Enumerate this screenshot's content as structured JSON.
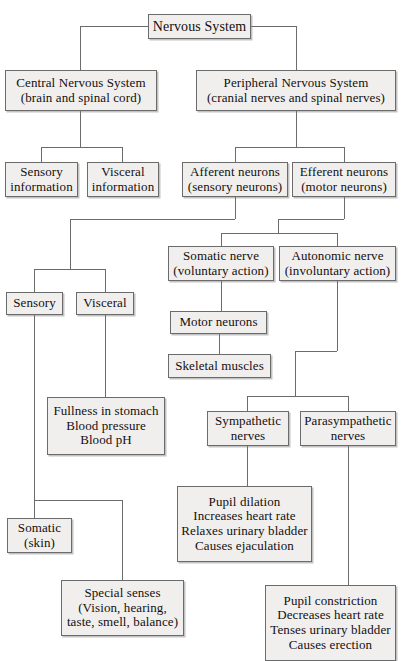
{
  "diagram": {
    "style": {
      "box_fill": "#f0efee",
      "box_border": "#6b6b6b",
      "text_color": "#14100e",
      "line_color": "#6b6b6b",
      "page_background": "#ffffff"
    },
    "nodes": [
      {
        "id": "nervous-system",
        "label": "Nervous System",
        "x": 148,
        "y": 14,
        "w": 103,
        "h": 25,
        "font": 14
      },
      {
        "id": "central-nervous-system",
        "label": "Central Nervous System\n(brain and spinal cord)",
        "x": 5,
        "y": 70,
        "w": 152,
        "h": 41,
        "font": 13
      },
      {
        "id": "peripheral-nervous-system",
        "label": "Peripheral Nervous System\n(cranial nerves and spinal nerves)",
        "x": 196,
        "y": 70,
        "w": 200,
        "h": 41,
        "font": 13
      },
      {
        "id": "sensory-information",
        "label": "Sensory\ninformation",
        "x": 5,
        "y": 162,
        "w": 73,
        "h": 35,
        "font": 13
      },
      {
        "id": "visceral-information",
        "label": "Visceral\ninformation",
        "x": 87,
        "y": 162,
        "w": 72,
        "h": 35,
        "font": 13
      },
      {
        "id": "afferent-neurons",
        "label": "Afferent neurons\n(sensory neurons)",
        "x": 182,
        "y": 162,
        "w": 106,
        "h": 35,
        "font": 13
      },
      {
        "id": "efferent-neurons",
        "label": "Efferent neurons\n(motor neurons)",
        "x": 292,
        "y": 162,
        "w": 104,
        "h": 35,
        "font": 13
      },
      {
        "id": "somatic-nerve",
        "label": "Somatic nerve\n(voluntary action)",
        "x": 168,
        "y": 246,
        "w": 106,
        "h": 35,
        "font": 13
      },
      {
        "id": "autonomic-nerve",
        "label": "Autonomic nerve\n(involuntary action)",
        "x": 279,
        "y": 246,
        "w": 117,
        "h": 35,
        "font": 13
      },
      {
        "id": "sensory",
        "label": "Sensory",
        "x": 6,
        "y": 292,
        "w": 57,
        "h": 23,
        "font": 13
      },
      {
        "id": "visceral",
        "label": "Visceral",
        "x": 76,
        "y": 292,
        "w": 58,
        "h": 23,
        "font": 13
      },
      {
        "id": "motor-neurons",
        "label": "Motor neurons",
        "x": 170,
        "y": 311,
        "w": 97,
        "h": 23,
        "font": 13
      },
      {
        "id": "skeletal-muscles",
        "label": "Skeletal muscles",
        "x": 168,
        "y": 354,
        "w": 103,
        "h": 24,
        "font": 13
      },
      {
        "id": "visceral-sensations",
        "label": "Fullness in stomach\nBlood pressure\nBlood pH",
        "x": 47,
        "y": 397,
        "w": 118,
        "h": 58,
        "font": 13
      },
      {
        "id": "sympathetic-nerves",
        "label": "Sympathetic\nnerves",
        "x": 207,
        "y": 411,
        "w": 82,
        "h": 35,
        "font": 13
      },
      {
        "id": "parasympathetic-nerves",
        "label": "Parasympathetic\nnerves",
        "x": 300,
        "y": 411,
        "w": 96,
        "h": 35,
        "font": 13
      },
      {
        "id": "somatic-skin",
        "label": "Somatic\n(skin)",
        "x": 7,
        "y": 518,
        "w": 65,
        "h": 35,
        "font": 13
      },
      {
        "id": "sympathetic-effects",
        "label": "Pupil dilation\nIncreases heart rate\nRelaxes urinary bladder\nCauses ejaculation",
        "x": 177,
        "y": 486,
        "w": 135,
        "h": 76,
        "font": 13
      },
      {
        "id": "special-senses",
        "label": "Special senses\n(Vision, hearing,\ntaste, smell, balance)",
        "x": 61,
        "y": 580,
        "w": 123,
        "h": 56,
        "font": 13
      },
      {
        "id": "parasympathetic-effects",
        "label": "Pupil constriction\nDecreases heart rate\nTenses urinary bladder\nCauses erection",
        "x": 265,
        "y": 585,
        "w": 131,
        "h": 76,
        "font": 13
      }
    ],
    "edges": [
      {
        "id": "edge-ns-to-cns",
        "from": "nervous-system",
        "to": "central-nervous-system",
        "path": "M 80 26 L 80 26 L 80 26"
      },
      {
        "id": "edge-ns-to-pns",
        "from": "nervous-system",
        "to": "peripheral-nervous-system",
        "path": "M 296 26 L 296 26"
      }
    ]
  }
}
